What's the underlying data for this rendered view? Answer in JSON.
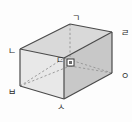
{
  "figure": {
    "name": "rectangular-prism-diagram",
    "shape": "rectangular prism (cuboid)",
    "projection": "oblique",
    "background_color": "#fdfdfd",
    "colors": {
      "top_face": "#d9d9d9",
      "left_face": "#e8e8e8",
      "front_face": "#c8c8c8",
      "visible_edge": "#4a4a4a",
      "hidden_edge": "#9a9a9a",
      "label_text": "#2b2b2b",
      "right_angle_marker": "#3a3a3a"
    },
    "vertices": [
      {
        "id": "g",
        "label": "ㄱ",
        "x": 72,
        "y": 14,
        "position": "top-back-right-upper",
        "hidden": true
      },
      {
        "id": "l",
        "label": "ㄹ",
        "x": 121,
        "y": 29,
        "position": "top-right",
        "hidden": false
      },
      {
        "id": "n",
        "label": "ㄴ",
        "x": 8,
        "y": 47,
        "position": "top-left",
        "hidden": false
      },
      {
        "id": "d",
        "label": "ㄷ",
        "x": 56,
        "y": 56,
        "position": "top-front",
        "hidden": false
      },
      {
        "id": "o",
        "label": "ㅇ",
        "x": 121,
        "y": 72,
        "position": "bottom-right",
        "hidden": false
      },
      {
        "id": "b",
        "label": "ㅂ",
        "x": 8,
        "y": 88,
        "position": "bottom-left",
        "hidden": false
      },
      {
        "id": "s",
        "label": "ㅅ",
        "x": 57,
        "y": 103,
        "position": "bottom-front",
        "hidden": false
      }
    ],
    "markers": [
      {
        "id": "right-angle",
        "label": "□",
        "x": 67,
        "y": 62,
        "description": "right angle square marker on front face"
      }
    ]
  }
}
